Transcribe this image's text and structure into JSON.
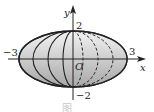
{
  "figure": {
    "type": "ellipsoid-of-revolution",
    "axes": {
      "x_label": "x",
      "y_label": "y",
      "origin_label": "O"
    },
    "ticks": {
      "x_neg": "−3",
      "x_pos": "3",
      "y_pos": "2",
      "y_neg": "−2"
    },
    "caption": "图",
    "colors": {
      "outline": "#222222",
      "fill_light": "#f2f2f2",
      "fill_dark": "#a9a9a9"
    }
  }
}
